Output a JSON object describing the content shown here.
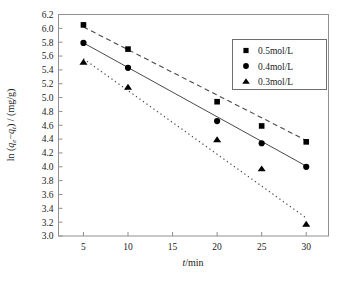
{
  "chart_data": {
    "type": "line",
    "title": "",
    "subtitle": "",
    "xlabel": "t/min",
    "ylabel": "ln (qe-qt) / (mg/g)",
    "ylabel_parts": {
      "prefix": "ln (",
      "q_sym": "q",
      "sub_e": "e",
      "minus": "−",
      "q_sym2": "q",
      "sub_t": "t",
      "suffix": ") / (mg/g)"
    },
    "xlabel_parts": {
      "var": "t",
      "unit": "/min"
    },
    "x": [
      5,
      10,
      20,
      25,
      30
    ],
    "xtick_labels": [
      "5",
      "10",
      "15",
      "20",
      "25",
      "30"
    ],
    "xticks": [
      5,
      10,
      15,
      20,
      25,
      30
    ],
    "xlim": [
      2.2,
      32.5
    ],
    "ytick_labels": [
      "3.0",
      "3.2",
      "3.4",
      "3.6",
      "3.8",
      "4.0",
      "4.2",
      "4.4",
      "4.6",
      "4.8",
      "5.0",
      "5.2",
      "5.4",
      "5.6",
      "5.8",
      "6.0",
      "6.2"
    ],
    "yticks": [
      3.0,
      3.2,
      3.4,
      3.6,
      3.8,
      4.0,
      4.2,
      4.4,
      4.6,
      4.8,
      5.0,
      5.2,
      5.4,
      5.6,
      5.8,
      6.0,
      6.2
    ],
    "ylim": [
      3.0,
      6.2
    ],
    "grid": false,
    "legend_position": "top-right",
    "series": [
      {
        "name": "0.5mol/L",
        "marker": "square",
        "linestyle": "dashed",
        "color": "#000000",
        "values": [
          6.05,
          5.7,
          4.94,
          4.59,
          4.36
        ],
        "fit": {
          "x0": 5,
          "y0": 6.02,
          "x1": 30,
          "y1": 4.38
        }
      },
      {
        "name": "0.4mol/L",
        "marker": "circle",
        "linestyle": "solid",
        "color": "#000000",
        "values": [
          5.79,
          5.43,
          4.66,
          4.34,
          4.0
        ],
        "fit": {
          "x0": 5,
          "y0": 5.79,
          "x1": 30,
          "y1": 4.01
        }
      },
      {
        "name": "0.3mol/L",
        "marker": "triangle",
        "linestyle": "dotted",
        "color": "#000000",
        "values": [
          5.51,
          5.15,
          4.39,
          3.97,
          3.17
        ],
        "fit": {
          "x0": 5,
          "y0": 5.56,
          "x1": 30,
          "y1": 3.26
        }
      }
    ]
  },
  "legend": {
    "items": [
      {
        "label": "0.5mol/L",
        "marker": "square"
      },
      {
        "label": "0.4mol/L",
        "marker": "circle"
      },
      {
        "label": "0.3mol/L",
        "marker": "triangle"
      }
    ]
  }
}
